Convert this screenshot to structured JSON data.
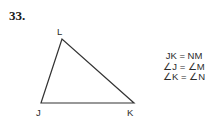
{
  "problem": {
    "number": "33."
  },
  "figure": {
    "type": "triangle",
    "stroke_color": "#333333",
    "stroke_width": 1.2,
    "fill": "none",
    "vertices": [
      {
        "name": "L",
        "label": "L",
        "x": 62,
        "y": 39,
        "label_x": 57,
        "label_y": 27
      },
      {
        "name": "J",
        "label": "J",
        "x": 41,
        "y": 103,
        "label_x": 36,
        "label_y": 108
      },
      {
        "name": "K",
        "label": "K",
        "x": 134,
        "y": 103,
        "label_x": 127,
        "label_y": 108
      }
    ]
  },
  "congruence_statements": {
    "lines": [
      "JK = NM",
      "∠J = ∠M",
      "∠K = ∠N"
    ]
  },
  "colors": {
    "background": "#ffffff",
    "text": "#2b2b2b",
    "number_text": "#1a1a1a",
    "line": "#333333"
  }
}
